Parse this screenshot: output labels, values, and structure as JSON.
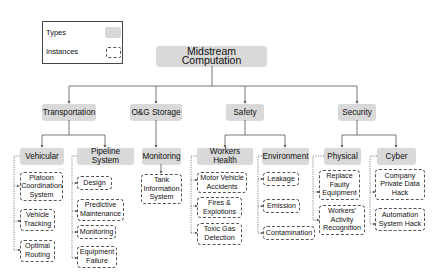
{
  "legend": {
    "types_label": "Types",
    "instances_label": "Instances"
  },
  "root": {
    "label": "Midstream Computation"
  },
  "categories": [
    {
      "label": "Transportation"
    },
    {
      "label": "O&G Storage"
    },
    {
      "label": "Safety"
    },
    {
      "label": "Security"
    }
  ],
  "types": [
    {
      "label": "Vehicular",
      "instances": [
        "Platoon Coordination System",
        "Vehicle Tracking",
        "Optimal Routing"
      ]
    },
    {
      "label": "Pipeline System",
      "instances": [
        "Design",
        "Predictive Maintenance",
        "Monitoring",
        "Equipment Failure"
      ]
    },
    {
      "label": "Monitoring",
      "instances": [
        "Tank Information System"
      ]
    },
    {
      "label": "Workers Health",
      "instances": [
        "Motor Vehicle Accidents",
        "Fires & Explotions",
        "Toxic Gas Detection"
      ]
    },
    {
      "label": "Environment",
      "instances": [
        "Leakage",
        "Emission",
        "Contamination"
      ]
    },
    {
      "label": "Physical",
      "instances": [
        "Replace Faulty Equipment",
        "Workers' Activity Recognition"
      ]
    },
    {
      "label": "Cyber",
      "instances": [
        "Company Private Data Hack",
        "Automation System Hack"
      ]
    }
  ],
  "colors": {
    "type_fill": "#d9d9d9",
    "line": "#555555"
  }
}
